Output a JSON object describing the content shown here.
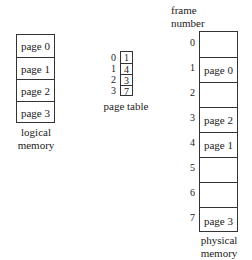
{
  "logical_memory": {
    "label_line1": "logical",
    "label_line2": "memory",
    "pages": [
      "page 0",
      "page 1",
      "page 2",
      "page 3"
    ]
  },
  "page_table": {
    "label": "page table",
    "indices": [
      "0",
      "1",
      "2",
      "3"
    ],
    "frames": [
      "1",
      "4",
      "3",
      "7"
    ]
  },
  "physical_memory": {
    "header_line1": "frame",
    "header_line2": "number",
    "label_line1": "physical",
    "label_line2": "memory",
    "frame_numbers": [
      "0",
      "1",
      "2",
      "3",
      "4",
      "5",
      "6",
      "7"
    ],
    "frames": [
      "",
      "page 0",
      "",
      "page 2",
      "page 1",
      "",
      "",
      "page 3"
    ]
  }
}
